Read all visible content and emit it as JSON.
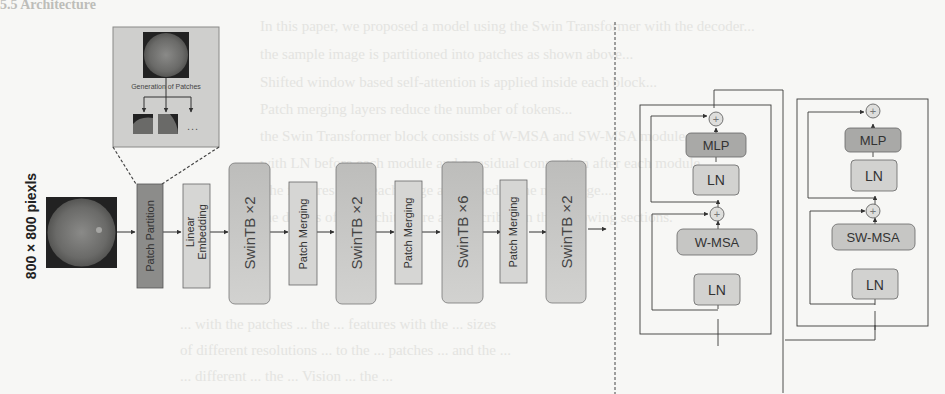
{
  "background_text": {
    "heading_fragment": "5.5 Architecture",
    "lines": [
      "In this paper, we proposed a model using the Swin Transformer with the decoder...",
      "the sample image is partitioned into patches as shown above...",
      "Shifted window based self-attention is applied inside each block...",
      "Patch merging layers reduce the number of tokens...",
      "the Swin Transformer block consists of W-MSA and SW-MSA modules...",
      "with LN before each module and a residual connection after each module.",
      "The features from each stage are passed to the next stage...",
      "the details of the architecture are described in the following sections.",
      "... with the patches ... the ... features with the ... sizes",
      "of different resolutions ... to the ... patches ... and the ... ",
      "... different ... the ... Vision ... the ... "
    ]
  },
  "input": {
    "label": "800 × 800 piexls",
    "image": "retina-fundus-image"
  },
  "inset": {
    "title": "Generation of Patches",
    "ellipsis": "..."
  },
  "pipeline": [
    {
      "id": "patch-partition",
      "label": "Patch Partition",
      "fill": "#8c8c8a"
    },
    {
      "id": "linear-embedding",
      "label": "Linear\nEmbedding",
      "line1": "Linear",
      "line2": "Embedding",
      "fill": "#d6d6d4"
    },
    {
      "id": "swintb-1",
      "label": "SwinTB ×2",
      "fill": "#c4c4c2"
    },
    {
      "id": "patch-merging-1",
      "label": "Patch Merging",
      "fill": "#d6d6d4"
    },
    {
      "id": "swintb-2",
      "label": "SwinTB ×2",
      "fill": "#c4c4c2"
    },
    {
      "id": "patch-merging-2",
      "label": "Patch Merging",
      "fill": "#d6d6d4"
    },
    {
      "id": "swintb-3",
      "label": "SwinTB ×6",
      "fill": "#c4c4c2"
    },
    {
      "id": "patch-merging-3",
      "label": "Patch Merging",
      "fill": "#d6d6d4"
    },
    {
      "id": "swintb-4",
      "label": "SwinTB ×2",
      "fill": "#c4c4c2"
    }
  ],
  "blocks": [
    {
      "name": "w-msa-block",
      "mlp": "MLP",
      "ln_top": "LN",
      "attn": "W-MSA",
      "ln_bottom": "LN",
      "plus": "+"
    },
    {
      "name": "sw-msa-block",
      "mlp": "MLP",
      "ln_top": "LN",
      "attn": "SW-MSA",
      "ln_bottom": "LN",
      "plus": "+"
    }
  ],
  "colors": {
    "dark_box": "#8c8c8a",
    "light_box": "#d6d6d4",
    "swin_box": "#c4c4c2",
    "mlp_box": "#a9a9a7",
    "line": "#3a3a3a",
    "inset_bg": "#cfcfcd"
  }
}
